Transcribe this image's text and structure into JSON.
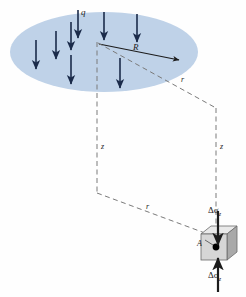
{
  "figure": {
    "name": "stress-increase-under-circular-loaded-area",
    "background_color": "#fefefe"
  },
  "loaded_area": {
    "shape_name": "circular-loaded-area-ellipse",
    "fill_color": "#bfd2e8",
    "center_x": 104,
    "center_y": 52,
    "radius_x": 94,
    "radius_y": 40
  },
  "labels": {
    "load": "q",
    "radius": "R",
    "radial_distance_upper": "r",
    "radial_distance_lower": "r",
    "depth_left": "z",
    "depth_right": "z",
    "point": "A",
    "stress_top": "Δσ",
    "stress_top_sub": "z",
    "stress_bottom": "Δσ",
    "stress_bottom_sub": "z"
  },
  "load_arrows": {
    "name": "distributed-load-arrows",
    "count": 10,
    "color": "#1b2b4a",
    "positions": [
      {
        "x": 36,
        "y1": 38,
        "y2": 68
      },
      {
        "x": 56,
        "y1": 30,
        "y2": 58
      },
      {
        "x": 72,
        "y1": 22,
        "y2": 52
      },
      {
        "x": 72,
        "y1": 52,
        "y2": 82
      },
      {
        "x": 76,
        "y1": 12,
        "y2": 40
      },
      {
        "x": 102,
        "y1": 14,
        "y2": 42
      },
      {
        "x": 118,
        "y1": 58,
        "y2": 90
      },
      {
        "x": 136,
        "y1": 16,
        "y2": 44
      }
    ]
  },
  "geometry": {
    "apex": {
      "x": 97,
      "y": 41
    },
    "radius_arrow": {
      "x1": 99,
      "y1": 44,
      "x2": 180,
      "y2": 60
    },
    "upper_r_line": {
      "x1": 98,
      "y1": 43,
      "x2": 216,
      "y2": 108
    },
    "left_vertical": {
      "x": 97,
      "y1": 42,
      "y2": 193
    },
    "right_vertical": {
      "x": 216,
      "y1": 108,
      "y2": 232
    },
    "lower_r_line": {
      "x1": 97,
      "y1": 193,
      "x2": 214,
      "y2": 236
    }
  },
  "element": {
    "name": "soil-stress-element-cube",
    "front_face_color": "#d4d4d4",
    "top_face_color": "#e8e8e8",
    "side_face_color": "#a8a8a8",
    "edge_color": "#5a5a5a",
    "point_marker_color": "#000000",
    "front_left": 201,
    "front_top": 234,
    "front_size": 26,
    "depth_offset": 10
  },
  "stress_arrows": {
    "top": {
      "x": 218,
      "y1": 212,
      "y2": 244,
      "direction": "down"
    },
    "bottom": {
      "x": 218,
      "y1": 290,
      "y2": 258,
      "direction": "up"
    },
    "color": "#1c1c1c"
  },
  "colors": {
    "dashed_line": "#7a7a7a",
    "solid_line": "#1c1c1c",
    "ellipse": "#bfd2e8"
  }
}
